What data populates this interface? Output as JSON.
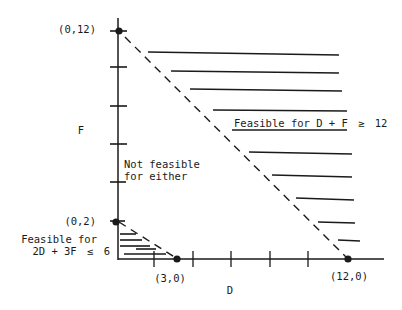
{
  "diagram": {
    "axes": {
      "x_label": "D",
      "y_label": "F"
    },
    "points": {
      "p_0_12": "(0,12)",
      "p_0_2": "(0,2)",
      "p_3_0": "(3,0)",
      "p_12_0": "(12,0)"
    },
    "regions": {
      "large": {
        "label_prefix": "Feasible for D + F",
        "label_op": "≥",
        "label_value": "12"
      },
      "small": {
        "line1": "Feasible for",
        "line2_prefix": "2D + 3F",
        "line2_op": "≤",
        "line2_value": "6"
      },
      "middle": {
        "line1": "Not feasible",
        "line2": "for either"
      }
    },
    "colors": {
      "ink": "#1a1a1a",
      "background": "#ffffff"
    }
  }
}
